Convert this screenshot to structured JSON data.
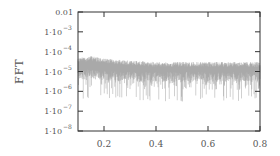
{
  "chart_data": {
    "type": "line",
    "title": "",
    "xlabel": "",
    "ylabel": "FFT",
    "xscale": "linear",
    "yscale": "log",
    "xlim": [
      0.1,
      0.8
    ],
    "ylim": [
      1e-08,
      0.01
    ],
    "grid": false,
    "legend": null,
    "x_ticks": [
      0.2,
      0.4,
      0.6,
      0.8
    ],
    "x_tick_labels": [
      "0.2",
      "0.4",
      "0.6",
      "0.8"
    ],
    "y_ticks": [
      0.01,
      0.001,
      0.0001,
      1e-05,
      1e-06,
      1e-07,
      1e-08
    ],
    "y_tick_labels": [
      {
        "base": "0.01",
        "exp": ""
      },
      {
        "base": "1·10",
        "exp": "−3"
      },
      {
        "base": "1·10",
        "exp": "−4"
      },
      {
        "base": "1·10",
        "exp": "−5"
      },
      {
        "base": "1·10",
        "exp": "−6"
      },
      {
        "base": "1·10",
        "exp": "−7"
      },
      {
        "base": "1·10",
        "exp": "−8"
      }
    ],
    "series": [
      {
        "name": "FFT",
        "color": "#a0a0a0",
        "description": "Noisy spectrum; dense band roughly 3e-6 to 4e-5, slightly elevated near x=0.1-0.2 (~6e-5), with downward spikes to ~3e-7",
        "envelope": {
          "x": [
            0.1,
            0.15,
            0.2,
            0.3,
            0.4,
            0.5,
            0.6,
            0.7,
            0.8
          ],
          "upper": [
            5e-05,
            6e-05,
            4.5e-05,
            3.5e-05,
            3e-05,
            3e-05,
            3e-05,
            3e-05,
            3e-05
          ],
          "band_lower": [
            4e-06,
            4e-06,
            3.5e-06,
            3e-06,
            3e-06,
            3e-06,
            3e-06,
            3e-06,
            3e-06
          ],
          "spike_min": [
            4e-07,
            3e-07,
            4e-07,
            4e-07,
            3e-07,
            3e-07,
            4e-07,
            3e-07,
            4e-07
          ]
        }
      }
    ]
  },
  "colors": {
    "axis": "#333333",
    "text": "#555555",
    "series": "#a0a0a0"
  }
}
